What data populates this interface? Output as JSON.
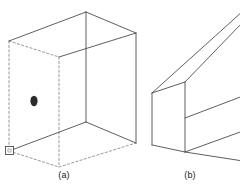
{
  "figure": {
    "background_color": "#ffffff",
    "line_color": "#4d4d4d",
    "hidden_line_color": "#808080",
    "marker_color": "#333333",
    "blob_color": "#2b2b2b",
    "panels": [
      {
        "id": "panel-a",
        "caption": "(a)",
        "description": "wireframe rectangular box with hidden dashed edges, interior dark blob and small square corner marker"
      },
      {
        "id": "panel-b",
        "caption": "(b)",
        "description": "elongated wireframe rectangular prism extending past the right edge"
      }
    ],
    "captions": {
      "a": "(a)",
      "b": "(b)"
    },
    "box_a": {
      "solid_edges": [
        {
          "name": "top-back-left",
          "x1": 9,
          "y1": 41,
          "x2": 86,
          "y2": 12
        },
        {
          "name": "top-back-right",
          "x1": 86,
          "y1": 12,
          "x2": 136,
          "y2": 33
        },
        {
          "name": "top-front-left",
          "x1": 9,
          "y1": 41,
          "x2": 59,
          "y2": 57
        },
        {
          "name": "top-front-right",
          "x1": 59,
          "y1": 57,
          "x2": 136,
          "y2": 33
        },
        {
          "name": "vertical-back-center",
          "x1": 86,
          "y1": 12,
          "x2": 86,
          "y2": 122
        },
        {
          "name": "vertical-front-right",
          "x1": 136,
          "y1": 33,
          "x2": 136,
          "y2": 143
        },
        {
          "name": "bottom-front-left",
          "x1": 9,
          "y1": 151,
          "x2": 86,
          "y2": 122
        },
        {
          "name": "bottom-front-right",
          "x1": 86,
          "y1": 122,
          "x2": 136,
          "y2": 143
        }
      ],
      "hidden_edges": [
        {
          "name": "hidden-left-vertical",
          "x1": 9,
          "y1": 41,
          "x2": 9,
          "y2": 151
        },
        {
          "name": "hidden-mid-vertical",
          "x1": 59,
          "y1": 57,
          "x2": 59,
          "y2": 167
        },
        {
          "name": "hidden-bottom-left",
          "x1": 9,
          "y1": 151,
          "x2": 59,
          "y2": 167
        },
        {
          "name": "hidden-bottom-right",
          "x1": 59,
          "y1": 167,
          "x2": 136,
          "y2": 143
        }
      ],
      "blob": {
        "cx": 34,
        "cy": 101,
        "rx": 3.6,
        "ry": 5.2
      },
      "corner_marker": {
        "x": 5,
        "y": 146,
        "size": 9
      }
    },
    "box_b": {
      "solid_edges": [
        {
          "name": "near-top-left",
          "x1": 152,
          "y1": 93,
          "x2": 185,
          "y2": 82
        },
        {
          "name": "near-top-right-long",
          "x1": 185,
          "y1": 82,
          "x2": 243,
          "y2": 22
        },
        {
          "name": "far-top-long",
          "x1": 152,
          "y1": 93,
          "x2": 243,
          "y2": 12
        },
        {
          "name": "near-vertical-left",
          "x1": 152,
          "y1": 93,
          "x2": 152,
          "y2": 145
        },
        {
          "name": "near-vertical-mid",
          "x1": 185,
          "y1": 82,
          "x2": 185,
          "y2": 152
        },
        {
          "name": "near-bottom-left",
          "x1": 152,
          "y1": 145,
          "x2": 185,
          "y2": 152
        },
        {
          "name": "lower-long-upper",
          "x1": 185,
          "y1": 118,
          "x2": 243,
          "y2": 96
        },
        {
          "name": "lower-long-edge",
          "x1": 185,
          "y1": 152,
          "x2": 243,
          "y2": 131
        },
        {
          "name": "bottom-long-edge",
          "x1": 185,
          "y1": 152,
          "x2": 243,
          "y2": 160
        }
      ]
    }
  }
}
